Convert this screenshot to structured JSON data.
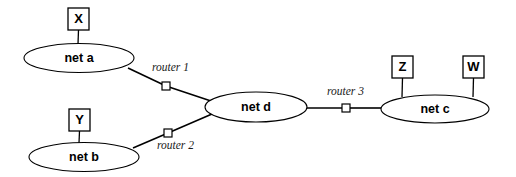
{
  "diagram": {
    "type": "network-topology",
    "background_color": "#ffffff",
    "stroke_color": "#000000",
    "networks": [
      {
        "id": "net-a",
        "label": "net a",
        "cx": 79,
        "cy": 58,
        "rx": 55,
        "ry": 14.5
      },
      {
        "id": "net-b",
        "label": "net b",
        "cx": 84,
        "cy": 157,
        "rx": 55,
        "ry": 14.5
      },
      {
        "id": "net-d",
        "label": "net d",
        "cx": 256,
        "cy": 107,
        "rx": 51,
        "ry": 15
      },
      {
        "id": "net-c",
        "label": "net c",
        "cx": 435,
        "cy": 109,
        "rx": 54,
        "ry": 14
      }
    ],
    "hosts": [
      {
        "id": "host-x",
        "label": "X",
        "x": 68,
        "y": 8,
        "w": 21,
        "h": 22,
        "stem_to_x": 78,
        "stem_to_y": 44
      },
      {
        "id": "host-y",
        "label": "Y",
        "x": 69,
        "y": 109,
        "w": 21,
        "h": 22,
        "stem_to_x": 79,
        "stem_to_y": 143
      },
      {
        "id": "host-z",
        "label": "Z",
        "x": 392,
        "y": 56,
        "w": 21,
        "h": 22,
        "stem_to_x": 402,
        "stem_to_y": 97
      },
      {
        "id": "host-w",
        "label": "W",
        "x": 463,
        "y": 56,
        "w": 21,
        "h": 22,
        "stem_to_x": 473,
        "stem_to_y": 97
      }
    ],
    "routers": [
      {
        "id": "router-1",
        "label": "router 1",
        "cx": 166,
        "cy": 86,
        "size": 8,
        "label_x": 152,
        "label_y": 68
      },
      {
        "id": "router-2",
        "label": "router 2",
        "cx": 168,
        "cy": 133,
        "size": 8,
        "label_x": 157,
        "label_y": 146
      },
      {
        "id": "router-3",
        "label": "router 3",
        "cx": 346,
        "cy": 108,
        "size": 8,
        "label_x": 327,
        "label_y": 92
      }
    ],
    "links": [
      {
        "id": "link-net-a-router-1",
        "x1": 128,
        "y1": 68,
        "x2": 166,
        "y2": 86
      },
      {
        "id": "link-router-1-net-d",
        "x1": 166,
        "y1": 86,
        "x2": 211,
        "y2": 101
      },
      {
        "id": "link-net-b-router-2",
        "x1": 133,
        "y1": 148,
        "x2": 168,
        "y2": 133
      },
      {
        "id": "link-router-2-net-d",
        "x1": 168,
        "y1": 133,
        "x2": 212,
        "y2": 114
      },
      {
        "id": "link-net-d-router-3",
        "x1": 307,
        "y1": 108,
        "x2": 342,
        "y2": 108
      },
      {
        "id": "link-router-3-net-c",
        "x1": 350,
        "y1": 108,
        "x2": 382,
        "y2": 108
      }
    ]
  }
}
